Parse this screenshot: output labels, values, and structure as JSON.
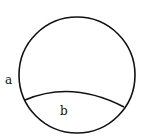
{
  "diagram": {
    "labels": {
      "a": "a",
      "b": "b"
    },
    "colors": {
      "stroke": "#111111",
      "background": "#ffffff"
    },
    "shapes": {
      "circle": {
        "cx": 77,
        "cy": 75,
        "r": 58
      },
      "chord_arc": {
        "start": [
          25,
          100
        ],
        "control": [
          72,
          80
        ],
        "end": [
          124,
          107
        ]
      }
    }
  }
}
